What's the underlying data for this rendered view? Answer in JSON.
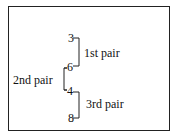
{
  "diagram": {
    "numbers": [
      "3",
      "6",
      "4",
      "8"
    ],
    "pairs": [
      {
        "label": "1st pair",
        "members": [
          "3",
          "6"
        ]
      },
      {
        "label": "2nd pair",
        "members": [
          "6",
          "4"
        ]
      },
      {
        "label": "3rd pair",
        "members": [
          "4",
          "8"
        ]
      }
    ]
  }
}
